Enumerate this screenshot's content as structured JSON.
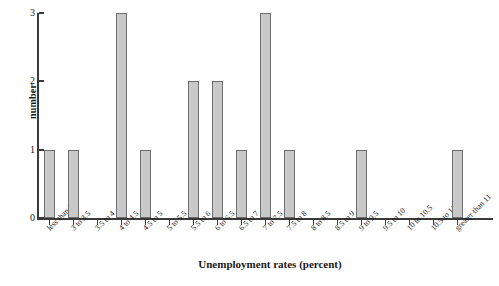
{
  "chart_data": {
    "type": "bar",
    "title": "",
    "xlabel": "Unemployment rates (percent)",
    "ylabel": "number",
    "ylim": [
      0,
      3
    ],
    "yticks": [
      "0",
      "1",
      "2",
      "3"
    ],
    "grid": false,
    "legend": "none",
    "bar_color": "#c9c9c9",
    "bar_edge_color": "#6e6e6e",
    "axis_color": "#3a3a3a",
    "categories": [
      "less than 3",
      "3 to 3.5",
      "3.5 to 4",
      "4 to 4.5",
      "4.5 to 5",
      "5 to 5.5",
      "5.5 to 6",
      "6 to 6.5",
      "6.5 to 7",
      "7 to 7.5",
      "7.5 to 8",
      "8 to 8.5",
      "8.5 to 9",
      "9 to 9.5",
      "9.5 to 10",
      "10 to 10.5",
      "10.5 to 11",
      "greater than 11"
    ],
    "values": [
      1,
      1,
      0,
      3,
      1,
      0,
      2,
      2,
      1,
      3,
      1,
      0,
      0,
      1,
      0,
      0,
      0,
      1
    ]
  }
}
